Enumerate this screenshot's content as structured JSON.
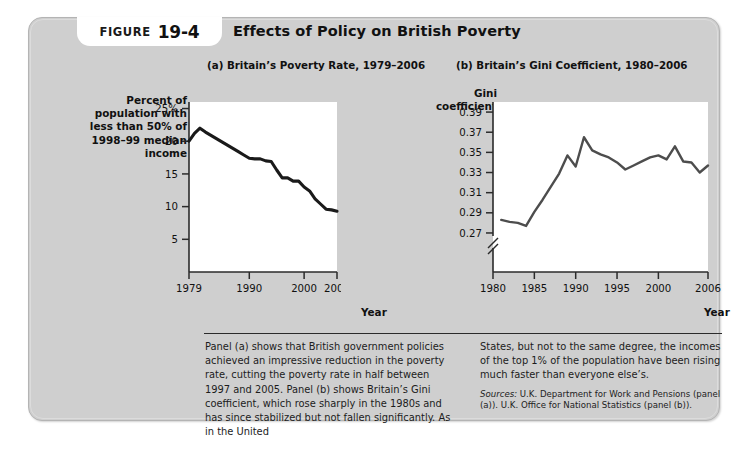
{
  "figure": {
    "label": "FIGURE",
    "number": "19-4",
    "title": "Effects of Policy on British Poverty"
  },
  "panel_a": {
    "subtitle": "(a) Britain’s Poverty Rate, 1979–2006",
    "y_axis_title": "Percent of population with less than 50% of 1998–99 median income",
    "x_axis_title": "Year",
    "y_ticks": [
      "25%",
      "20",
      "15",
      "10",
      "5"
    ],
    "x_ticks": [
      "1979",
      "1990",
      "2000",
      "2006"
    ]
  },
  "panel_b": {
    "subtitle": "(b) Britain’s Gini Coefficient, 1980–2006",
    "y_axis_title": "Gini coefficient",
    "x_axis_title": "Year",
    "y_ticks": [
      "0.39",
      "0.37",
      "0.35",
      "0.33",
      "0.31",
      "0.29",
      "0.27"
    ],
    "x_ticks": [
      "1980",
      "1985",
      "1990",
      "1995",
      "2000",
      "2006"
    ],
    "axis_break": true
  },
  "caption": {
    "left_paragraph": "Panel (a) shows that British government policies achieved an impressive reduction in the poverty rate, cutting the poverty rate in half between 1997 and 2005. Panel (b) shows Britain’s Gini coefficient, which rose sharply in the 1980s and has since stabilized but not fallen significantly. As in the United",
    "right_paragraph": "States, but not to the same degree, the incomes of the top 1% of the population have been rising much faster than everyone else’s.",
    "sources_label": "Sources:",
    "sources_text": "U.K. Department for Work and Pensions (panel (a)). U.K. Office for National Statistics (panel (b))."
  },
  "colors": {
    "card_background": "#cfcfcf",
    "plot_background": "#ffffff",
    "line_a": "#1a1a1a",
    "line_b": "#4d4d4d",
    "axis": "#2b2b2b",
    "text": "#111111"
  },
  "chart_data": [
    {
      "type": "line",
      "title": "(a) Britain’s Poverty Rate, 1979–2006",
      "xlabel": "Year",
      "ylabel": "Percent of population with less than 50% of 1998–99 median income",
      "xlim": [
        1979,
        2006
      ],
      "ylim": [
        0,
        26
      ],
      "grid": false,
      "legend": "none",
      "x": [
        1979,
        1980,
        1981,
        1982,
        1983,
        1984,
        1985,
        1986,
        1987,
        1988,
        1989,
        1990,
        1991,
        1992,
        1993,
        1994,
        1995,
        1996,
        1997,
        1998,
        1999,
        2000,
        2001,
        2002,
        2003,
        2004,
        2005,
        2006
      ],
      "values": [
        20.0,
        21.2,
        22.0,
        21.4,
        20.9,
        20.4,
        19.9,
        19.4,
        18.9,
        18.4,
        17.9,
        17.4,
        17.3,
        17.3,
        17.0,
        16.9,
        15.6,
        14.4,
        14.4,
        13.9,
        13.9,
        13.0,
        12.4,
        11.2,
        10.4,
        9.6,
        9.5,
        9.3
      ],
      "y_ticks": [
        5,
        10,
        15,
        20,
        25
      ],
      "x_ticks": [
        1979,
        1990,
        2000,
        2006
      ],
      "series_name": "Poverty rate"
    },
    {
      "type": "line",
      "title": "(b) Britain’s Gini Coefficient, 1980–2006",
      "xlabel": "Year",
      "ylabel": "Gini coefficient",
      "xlim": [
        1980,
        2006
      ],
      "ylim": [
        0.26,
        0.4
      ],
      "axis_break": true,
      "grid": false,
      "legend": "none",
      "x": [
        1981,
        1982,
        1983,
        1984,
        1985,
        1986,
        1987,
        1988,
        1989,
        1990,
        1991,
        1992,
        1993,
        1994,
        1995,
        1996,
        1997,
        1998,
        1999,
        2000,
        2001,
        2002,
        2003,
        2004,
        2005,
        2006
      ],
      "values": [
        0.283,
        0.281,
        0.28,
        0.277,
        0.291,
        0.303,
        0.316,
        0.329,
        0.347,
        0.336,
        0.365,
        0.352,
        0.348,
        0.345,
        0.34,
        0.333,
        0.337,
        0.341,
        0.345,
        0.347,
        0.343,
        0.356,
        0.341,
        0.34,
        0.33,
        0.337
      ],
      "y_ticks": [
        0.27,
        0.29,
        0.31,
        0.33,
        0.35,
        0.37,
        0.39
      ],
      "x_ticks": [
        1980,
        1985,
        1990,
        1995,
        2000,
        2006
      ],
      "series_name": "Gini coefficient"
    }
  ]
}
